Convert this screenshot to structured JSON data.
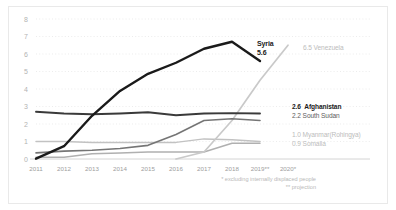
{
  "chart_data": {
    "type": "line",
    "title": "",
    "xlabel": "",
    "ylabel": "",
    "ylim": [
      0,
      8
    ],
    "yticks": [
      0,
      1,
      2,
      3,
      4,
      5,
      6,
      7,
      8
    ],
    "grid": true,
    "legend_position": "right-inline-end-labels",
    "x": [
      "2011",
      "2012",
      "2013",
      "2014",
      "2015",
      "2016",
      "2017",
      "2018",
      "2019**",
      "2020*"
    ],
    "xtick_labels": [
      "2011",
      "2012",
      "2013",
      "2014",
      "2015",
      "2016",
      "2017",
      "2018",
      "2019**",
      "2020*"
    ],
    "series": [
      {
        "name": "Syria",
        "end_value": "5.6",
        "end_label": "Syria",
        "color": "#1a1a1a",
        "values": [
          0.02,
          0.73,
          2.47,
          3.89,
          4.87,
          5.5,
          6.3,
          6.7,
          5.6,
          null
        ]
      },
      {
        "name": "Venezuela",
        "end_value": "6.5",
        "end_label": "Venezuela",
        "color": "#c9c9c9",
        "values": [
          null,
          null,
          null,
          null,
          null,
          0.0,
          0.4,
          2.2,
          4.5,
          6.5
        ]
      },
      {
        "name": "Afghanistan",
        "end_value": "2.6",
        "end_label": "Afghanistan",
        "color": "#3a3a3a",
        "values": [
          2.7,
          2.6,
          2.56,
          2.6,
          2.67,
          2.5,
          2.6,
          2.62,
          2.6,
          null
        ]
      },
      {
        "name": "South Sudan",
        "end_value": "2.2",
        "end_label": "South Sudan",
        "color": "#757575",
        "values": [
          0.35,
          0.45,
          0.5,
          0.6,
          0.78,
          1.4,
          2.2,
          2.3,
          2.2,
          null
        ]
      },
      {
        "name": "Myanmar (Rohingya)",
        "end_value": "1.0",
        "end_label": "Myanmar(Rohingya)",
        "color": "#c2c2c2",
        "values": [
          1.0,
          1.0,
          0.95,
          0.95,
          0.95,
          0.95,
          1.15,
          1.1,
          1.0,
          null
        ]
      },
      {
        "name": "Somalia",
        "end_value": "0.9",
        "end_label": "Somalia",
        "color": "#b0b0b0",
        "values": [
          0.1,
          0.1,
          0.3,
          0.35,
          0.4,
          0.4,
          0.4,
          0.9,
          0.9,
          null
        ]
      }
    ],
    "footnotes": [
      "* excluding internally displaced people",
      "** projection"
    ]
  }
}
